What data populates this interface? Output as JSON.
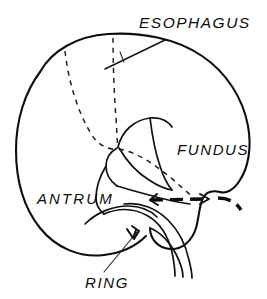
{
  "figure": {
    "kind": "anatomical-line-drawing",
    "background_color": "#ffffff",
    "ink_color": "#0d0d0d",
    "width": 267,
    "height": 299
  },
  "labels": {
    "esophagus": "ESOPHAGUS",
    "fundus": "FUNDUS",
    "antrum": "ANTRUM",
    "ring": "RING"
  },
  "label_positions": {
    "esophagus": {
      "x": 139,
      "y": 28
    },
    "fundus": {
      "x": 177,
      "y": 155
    },
    "antrum": {
      "x": 37,
      "y": 204
    },
    "ring": {
      "x": 85,
      "y": 288
    }
  },
  "annotations": {
    "esophagus_leader": "diagonal line from label down-left across the superior gastric outline",
    "fundus_leader": "dashed line running from the cardia junction down-right beneath the label",
    "antrum_leader": "label abuts the antral wall contour directly",
    "ring_leader": "thin line from label up-right to an arrowhead on the ring arc"
  },
  "strokes": {
    "outline": "solid-heavy",
    "interior_folds": "solid-medium",
    "mucosal_outlines": "dashed-fine",
    "ring_marker": "dashed-heavy"
  }
}
